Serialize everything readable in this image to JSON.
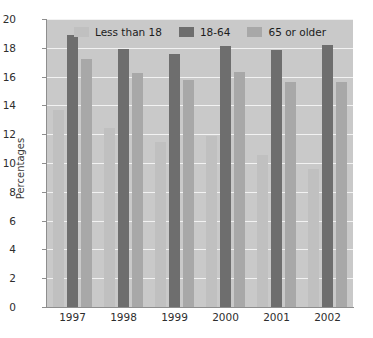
{
  "chart_data": {
    "type": "bar",
    "title": "",
    "xlabel": "",
    "ylabel": "Percentages",
    "ylim": [
      0,
      20
    ],
    "ytick_step": 2,
    "yticks": [
      0,
      2,
      4,
      6,
      8,
      10,
      12,
      14,
      16,
      18,
      20
    ],
    "grid": true,
    "legend_position": "top-center",
    "categories": [
      "1997",
      "1998",
      "1999",
      "2000",
      "2001",
      "2002"
    ],
    "series": [
      {
        "name": "Less than 18",
        "color": "#c0c0c0",
        "values": [
          13.7,
          12.4,
          11.45,
          11.85,
          10.55,
          9.6
        ]
      },
      {
        "name": "18-64",
        "color": "#6e6e6e",
        "values": [
          18.9,
          17.95,
          17.55,
          18.15,
          17.85,
          18.2
        ]
      },
      {
        "name": "65 or older",
        "color": "#a8a8a8",
        "values": [
          17.2,
          16.25,
          15.75,
          16.35,
          15.6,
          15.6
        ]
      }
    ]
  },
  "style": {
    "plot_background": "#c9c9c9",
    "gridline_color": "#f2f2f2",
    "axis_color": "#8e8e8e",
    "page_background": "#ffffff"
  }
}
